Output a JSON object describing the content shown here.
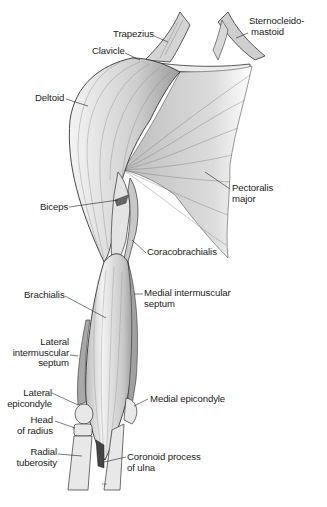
{
  "figure": {
    "signature": "ra"
  },
  "labels": {
    "sternocleidomastoid": {
      "line1": "Sternocleido-",
      "line2": "mastoid"
    },
    "trapezius": {
      "line1": "Trapezius"
    },
    "clavicle": {
      "line1": "Clavicle"
    },
    "deltoid": {
      "line1": "Deltoid"
    },
    "pectoralis_major": {
      "line1": "Pectoralis",
      "line2": "major"
    },
    "biceps": {
      "line1": "Biceps"
    },
    "coracobrachialis": {
      "line1": "Coracobrachialis"
    },
    "brachialis": {
      "line1": "Brachialis"
    },
    "medial_intermuscular_septum": {
      "line1": "Medial intermuscular",
      "line2": "septum"
    },
    "lateral_intermuscular_septum": {
      "line1": "Lateral",
      "line2": "intermuscular",
      "line3": "septum"
    },
    "lateral_epicondyle": {
      "line1": "Lateral",
      "line2": "epicondyle"
    },
    "medial_epicondyle": {
      "line1": "Medial epicondyle"
    },
    "head_of_radius": {
      "line1": "Head",
      "line2": "of radius"
    },
    "radial_tuberosity": {
      "line1": "Radial",
      "line2": "tuberosity"
    },
    "coronoid_process_of_ulna": {
      "line1": "Coronoid process",
      "line2": "of ulna"
    }
  },
  "colors": {
    "ink": "#222222",
    "muscle_fill": "#d9d9d9",
    "muscle_shadow": "#a8a8a8",
    "bone_fill": "#e6e6e6",
    "background": "#ffffff"
  }
}
